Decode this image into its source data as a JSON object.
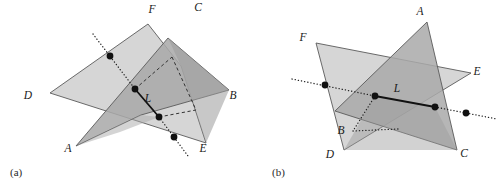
{
  "figure": {
    "background": "#ffffff",
    "width": 504,
    "height": 186,
    "colors": {
      "plane_light": "#d6d6d6",
      "plane_mid": "#c2c2c2",
      "plane_dark": "#a9a9a9",
      "plane_darker": "#9b9b9b",
      "edge": "#5a5a5a",
      "ink": "#111111"
    }
  },
  "panels": [
    {
      "id": "a",
      "caption": "(a)",
      "caption_pos": {
        "x": 10,
        "y": 176
      },
      "line_label": "L",
      "line_label_pos": {
        "x": 148,
        "y": 102
      },
      "vertex_labels": [
        {
          "name": "D",
          "text": "D",
          "x": 28,
          "y": 99
        },
        {
          "name": "F",
          "text": "F",
          "x": 152,
          "y": 13
        },
        {
          "name": "C",
          "text": "C",
          "x": 198,
          "y": 11
        },
        {
          "name": "B",
          "text": "B",
          "x": 233,
          "y": 99
        },
        {
          "name": "E",
          "text": "E",
          "x": 203,
          "y": 152
        },
        {
          "name": "A",
          "text": "A",
          "x": 68,
          "y": 152
        }
      ],
      "plane_light_points": "50,93 148,24 181,66 206,143",
      "plane_dark_points": "76,146 168,38 229,90 141,115",
      "intersection_dots": [
        {
          "x": 110,
          "y": 56
        },
        {
          "x": 135,
          "y": 89
        },
        {
          "x": 159,
          "y": 117
        },
        {
          "x": 174,
          "y": 137
        }
      ],
      "solid_segment": {
        "x1": 135,
        "y1": 89,
        "x2": 159,
        "y2": 117
      },
      "dotted_upper": {
        "x1": 93,
        "y1": 34,
        "x2": 135,
        "y2": 89
      },
      "dotted_lower": {
        "x1": 159,
        "y1": 117,
        "x2": 188,
        "y2": 156
      },
      "dashed_a": {
        "x1": 135,
        "y1": 89,
        "x2": 172,
        "y2": 57
      },
      "dashed_b": {
        "x1": 159,
        "y1": 117,
        "x2": 196,
        "y2": 110
      }
    },
    {
      "id": "b",
      "caption": "(b)",
      "caption_pos": {
        "x": 272,
        "y": 176
      },
      "line_label": "L",
      "line_label_pos": {
        "x": 397,
        "y": 92
      },
      "vertex_labels": [
        {
          "name": "F",
          "text": "F",
          "x": 303,
          "y": 41
        },
        {
          "name": "A",
          "text": "A",
          "x": 420,
          "y": 15
        },
        {
          "name": "E",
          "text": "E",
          "x": 477,
          "y": 75
        },
        {
          "name": "B",
          "text": "B",
          "x": 341,
          "y": 134
        },
        {
          "name": "D",
          "text": "D",
          "x": 330,
          "y": 158
        },
        {
          "name": "C",
          "text": "C",
          "x": 464,
          "y": 157
        }
      ],
      "plane_light_points": "316,43 471,73 344,150",
      "plane_dark_points": "427,22 457,150 335,111",
      "intersection_dots": [
        {
          "x": 325,
          "y": 85
        },
        {
          "x": 375,
          "y": 96
        },
        {
          "x": 435,
          "y": 107
        },
        {
          "x": 466,
          "y": 113
        }
      ],
      "solid_segment": {
        "x1": 375,
        "y1": 96,
        "x2": 435,
        "y2": 107
      },
      "dotted_left": {
        "x1": 292,
        "y1": 79,
        "x2": 375,
        "y2": 96
      },
      "dotted_right": {
        "x1": 435,
        "y1": 107,
        "x2": 497,
        "y2": 119
      },
      "dotted_corner_v": {
        "x1": 375,
        "y1": 96,
        "x2": 353,
        "y2": 131
      },
      "dotted_corner_h": {
        "x1": 353,
        "y1": 131,
        "x2": 398,
        "y2": 129
      }
    }
  ]
}
